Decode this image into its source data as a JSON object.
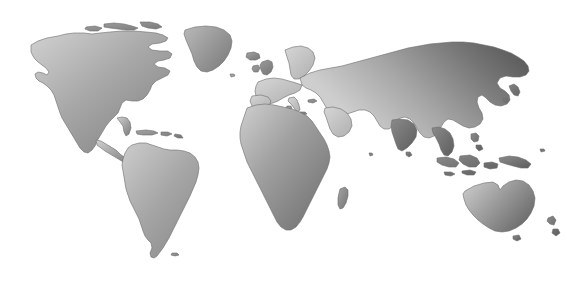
{
  "figure": {
    "kind": "world-map",
    "title": "World map",
    "background_color": "#ffffff",
    "projection": "equirectangular",
    "has_labels": false,
    "has_graticule": false,
    "has_legend": false
  },
  "rule": {
    "name": "top-horizontal-rule",
    "color": "#4a4a4a",
    "x": 30,
    "y": 6,
    "width": 510,
    "thickness": 1
  },
  "palette": {
    "land_light": "#d2d2d2",
    "land_mid": "#9a9a9a",
    "land_dark": "#5a5a5a",
    "land_outline": "#6b6b6b",
    "ocean": "#ffffff"
  },
  "landmasses": [
    {
      "id": "north-america",
      "label": "North America",
      "shade": "light-to-mid"
    },
    {
      "id": "greenland",
      "label": "Greenland",
      "shade": "mid-to-dark"
    },
    {
      "id": "south-america",
      "label": "South America",
      "shade": "light-to-mid"
    },
    {
      "id": "africa",
      "label": "Africa",
      "shade": "light-to-dark"
    },
    {
      "id": "madagascar",
      "label": "Madagascar",
      "shade": "mid"
    },
    {
      "id": "europe",
      "label": "Europe",
      "shade": "light"
    },
    {
      "id": "british-isles",
      "label": "British Isles",
      "shade": "mid"
    },
    {
      "id": "scandinavia",
      "label": "Scandinavia",
      "shade": "light-to-mid"
    },
    {
      "id": "iceland",
      "label": "Iceland",
      "shade": "mid"
    },
    {
      "id": "asia",
      "label": "Asia",
      "shade": "light-to-dark"
    },
    {
      "id": "arabia",
      "label": "Arabian Peninsula",
      "shade": "light"
    },
    {
      "id": "india",
      "label": "India",
      "shade": "dark"
    },
    {
      "id": "japan",
      "label": "Japan",
      "shade": "dark"
    },
    {
      "id": "southeast-asia",
      "label": "Southeast Asia",
      "shade": "dark"
    },
    {
      "id": "indonesia",
      "label": "Indonesia",
      "shade": "dark"
    },
    {
      "id": "philippines",
      "label": "Philippines",
      "shade": "dark"
    },
    {
      "id": "new-guinea",
      "label": "New Guinea",
      "shade": "dark"
    },
    {
      "id": "australia",
      "label": "Australia",
      "shade": "light-to-dark"
    },
    {
      "id": "new-zealand",
      "label": "New Zealand",
      "shade": "dark"
    },
    {
      "id": "caribbean",
      "label": "Caribbean Islands",
      "shade": "mid"
    },
    {
      "id": "falklands",
      "label": "Falkland Islands",
      "shade": "mid"
    },
    {
      "id": "sri-lanka",
      "label": "Sri Lanka",
      "shade": "dark"
    },
    {
      "id": "arctic-islands",
      "label": "Canadian Arctic Archipelago",
      "shade": "mid-to-dark"
    }
  ]
}
